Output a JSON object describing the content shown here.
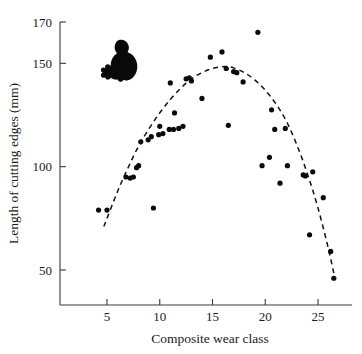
{
  "figure": {
    "background_color": "#ffffff",
    "point_color": "#0b0b0b",
    "curve_color": "#111111",
    "axis_color": "#3a3a3a",
    "decoration_icon": "koala-silhouette-icon"
  },
  "axes": {
    "x_title": "Composite wear class",
    "y_title": "Length of cutting edges (mm)",
    "x_ticks": [
      "5",
      "10",
      "15",
      "20",
      "25"
    ],
    "y_ticks": [
      "50",
      "100",
      "150",
      "170"
    ]
  },
  "chart_data": {
    "type": "scatter",
    "title": "",
    "xlabel": "Composite wear class",
    "ylabel": "Length of cutting edges (mm)",
    "xlim": [
      2.5,
      28.5
    ],
    "ylim": [
      30,
      172
    ],
    "xticks": [
      5,
      10,
      15,
      20,
      25
    ],
    "yticks": [
      50,
      100,
      150,
      170
    ],
    "grid": false,
    "legend": null,
    "annotations": [
      {
        "name": "koala-silhouette",
        "type": "icon",
        "x": 8.0,
        "y": 152.0
      }
    ],
    "series": [
      {
        "name": "Specimens",
        "marker": "filled-circle",
        "color": "#0b0b0b",
        "points": [
          [
            4.2,
            79.0
          ],
          [
            5.0,
            79.0
          ],
          [
            6.8,
            95.0
          ],
          [
            7.2,
            94.5
          ],
          [
            7.5,
            95.0
          ],
          [
            7.8,
            99.5
          ],
          [
            8.0,
            100.5
          ],
          [
            8.2,
            112.0
          ],
          [
            8.9,
            113.0
          ],
          [
            9.2,
            114.5
          ],
          [
            9.4,
            80.0
          ],
          [
            9.9,
            115.5
          ],
          [
            10.0,
            119.5
          ],
          [
            10.3,
            116.0
          ],
          [
            10.9,
            118.0
          ],
          [
            11.0,
            140.5
          ],
          [
            11.3,
            118.0
          ],
          [
            11.4,
            126.0
          ],
          [
            11.8,
            118.5
          ],
          [
            12.2,
            119.5
          ],
          [
            12.5,
            142.5
          ],
          [
            12.8,
            143.0
          ],
          [
            13.0,
            141.5
          ],
          [
            14.0,
            133.0
          ],
          [
            14.8,
            153.0
          ],
          [
            15.9,
            155.5
          ],
          [
            16.3,
            147.5
          ],
          [
            16.5,
            120.0
          ],
          [
            17.0,
            146.0
          ],
          [
            17.3,
            145.5
          ],
          [
            17.9,
            141.0
          ],
          [
            19.3,
            165.0
          ],
          [
            19.7,
            100.5
          ],
          [
            20.4,
            104.5
          ],
          [
            20.6,
            127.5
          ],
          [
            20.9,
            118.0
          ],
          [
            21.4,
            92.0
          ],
          [
            21.9,
            118.5
          ],
          [
            22.1,
            100.5
          ],
          [
            23.6,
            96.0
          ],
          [
            23.8,
            95.5
          ],
          [
            24.2,
            67.0
          ],
          [
            24.5,
            97.5
          ],
          [
            25.5,
            85.0
          ],
          [
            26.2,
            59.0
          ],
          [
            26.5,
            46.0
          ]
        ]
      }
    ],
    "fit": {
      "name": "quadratic-trend",
      "style": "dashed",
      "color": "#111111",
      "x_range": [
        4.7,
        26.6
      ],
      "vertex": [
        16.2,
        148.5
      ],
      "points": [
        [
          4.7,
          71.0
        ],
        [
          6.0,
          88.0
        ],
        [
          7.0,
          99.5
        ],
        [
          8.0,
          110.0
        ],
        [
          9.0,
          118.5
        ],
        [
          10.0,
          126.0
        ],
        [
          11.0,
          132.5
        ],
        [
          12.0,
          138.0
        ],
        [
          13.0,
          142.5
        ],
        [
          14.0,
          145.5
        ],
        [
          15.0,
          147.5
        ],
        [
          16.2,
          148.5
        ],
        [
          17.0,
          147.8
        ],
        [
          18.0,
          145.5
        ],
        [
          19.0,
          142.0
        ],
        [
          20.0,
          137.0
        ],
        [
          21.0,
          130.5
        ],
        [
          22.0,
          122.0
        ],
        [
          23.0,
          110.5
        ],
        [
          24.0,
          96.5
        ],
        [
          25.0,
          80.0
        ],
        [
          26.0,
          60.0
        ],
        [
          26.6,
          46.0
        ]
      ]
    }
  }
}
